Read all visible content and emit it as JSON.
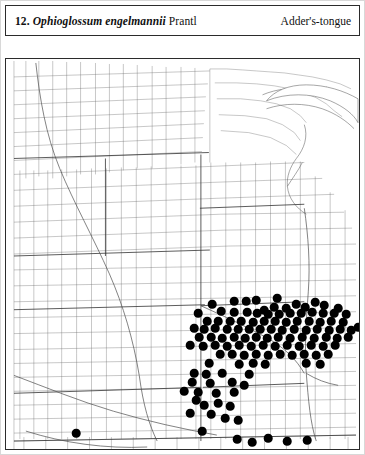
{
  "figure": {
    "number": "12.",
    "scientific_name": "Ophioglossum engelmannii",
    "authority": "Prantl",
    "common_name": "Adder's-tongue"
  },
  "map": {
    "type": "county-dot-distribution-map",
    "region": "central-united-states",
    "dot_color": "#000000",
    "line_color": "#555555",
    "background_color": "#ffffff",
    "border_color": "#2b2b2b",
    "dot_radius_px": 4.3,
    "dot_count": 118
  },
  "chart_data": {
    "type": "scatter",
    "title": "Ophioglossum engelmannii Prantl",
    "xlabel": "",
    "ylabel": "",
    "legend": [],
    "points": [
      [
        206,
        303
      ],
      [
        228,
        300
      ],
      [
        240,
        300
      ],
      [
        250,
        299
      ],
      [
        271,
        297
      ],
      [
        290,
        303
      ],
      [
        309,
        301
      ],
      [
        258,
        309
      ],
      [
        268,
        306
      ],
      [
        280,
        307
      ],
      [
        299,
        306
      ],
      [
        318,
        304
      ],
      [
        332,
        307
      ],
      [
        192,
        312
      ],
      [
        215,
        310
      ],
      [
        228,
        311
      ],
      [
        241,
        311
      ],
      [
        251,
        312
      ],
      [
        262,
        313
      ],
      [
        273,
        313
      ],
      [
        284,
        312
      ],
      [
        295,
        312
      ],
      [
        306,
        311
      ],
      [
        317,
        312
      ],
      [
        328,
        312
      ],
      [
        340,
        313
      ],
      [
        201,
        320
      ],
      [
        212,
        320
      ],
      [
        224,
        320
      ],
      [
        235,
        320
      ],
      [
        247,
        321
      ],
      [
        258,
        320
      ],
      [
        269,
        320
      ],
      [
        280,
        321
      ],
      [
        291,
        320
      ],
      [
        303,
        320
      ],
      [
        314,
        321
      ],
      [
        325,
        320
      ],
      [
        337,
        321
      ],
      [
        188,
        327
      ],
      [
        198,
        328
      ],
      [
        209,
        327
      ],
      [
        221,
        328
      ],
      [
        232,
        328
      ],
      [
        243,
        328
      ],
      [
        254,
        328
      ],
      [
        265,
        328
      ],
      [
        276,
        329
      ],
      [
        288,
        328
      ],
      [
        300,
        329
      ],
      [
        311,
        328
      ],
      [
        323,
        329
      ],
      [
        334,
        328
      ],
      [
        345,
        329
      ],
      [
        352,
        326
      ],
      [
        193,
        336
      ],
      [
        205,
        336
      ],
      [
        216,
        337
      ],
      [
        228,
        336
      ],
      [
        239,
        337
      ],
      [
        250,
        336
      ],
      [
        261,
        337
      ],
      [
        272,
        336
      ],
      [
        284,
        337
      ],
      [
        296,
        336
      ],
      [
        308,
        337
      ],
      [
        320,
        336
      ],
      [
        331,
        337
      ],
      [
        342,
        336
      ],
      [
        184,
        344
      ],
      [
        197,
        345
      ],
      [
        209,
        344
      ],
      [
        221,
        345
      ],
      [
        233,
        344
      ],
      [
        245,
        345
      ],
      [
        257,
        344
      ],
      [
        269,
        345
      ],
      [
        281,
        344
      ],
      [
        293,
        345
      ],
      [
        305,
        344
      ],
      [
        317,
        345
      ],
      [
        329,
        344
      ],
      [
        214,
        353
      ],
      [
        226,
        353
      ],
      [
        238,
        354
      ],
      [
        250,
        353
      ],
      [
        262,
        354
      ],
      [
        274,
        353
      ],
      [
        286,
        354
      ],
      [
        298,
        353
      ],
      [
        310,
        354
      ],
      [
        322,
        353
      ],
      [
        203,
        362
      ],
      [
        233,
        363
      ],
      [
        247,
        362
      ],
      [
        259,
        363
      ],
      [
        300,
        362
      ],
      [
        314,
        363
      ],
      [
        188,
        372
      ],
      [
        200,
        373
      ],
      [
        216,
        372
      ],
      [
        243,
        373
      ],
      [
        186,
        381
      ],
      [
        204,
        382
      ],
      [
        226,
        381
      ],
      [
        238,
        384
      ],
      [
        178,
        390
      ],
      [
        192,
        391
      ],
      [
        210,
        392
      ],
      [
        228,
        391
      ],
      [
        190,
        399
      ],
      [
        198,
        404
      ],
      [
        212,
        402
      ],
      [
        224,
        405
      ],
      [
        184,
        412
      ],
      [
        205,
        413
      ],
      [
        219,
        417
      ],
      [
        232,
        419
      ],
      [
        70,
        432
      ],
      [
        196,
        430
      ],
      [
        231,
        438
      ],
      [
        246,
        441
      ],
      [
        262,
        437
      ],
      [
        281,
        440
      ],
      [
        301,
        439
      ]
    ],
    "xlim": [
      0,
      355
    ],
    "ylim": [
      0,
      392
    ],
    "grid": false
  }
}
